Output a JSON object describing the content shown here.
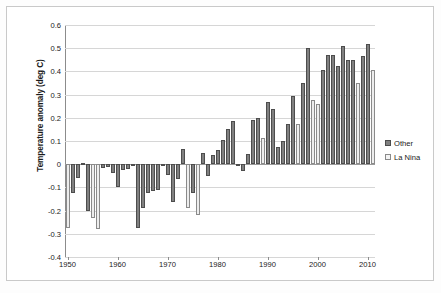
{
  "chart_data": {
    "type": "bar",
    "title": "",
    "xlabel": "",
    "ylabel": "Temperature anomaly (deg C)",
    "ylim": [
      -0.4,
      0.6
    ],
    "xlim": [
      1949.2,
      1911.8
    ],
    "grid": true,
    "legend_position": "right",
    "ytick_labels": [
      "0.6",
      "0.5",
      "0.4",
      "0.3",
      "0.2",
      "0.1",
      "0",
      "-0.1",
      "-0.2",
      "-0.3",
      "-0.4"
    ],
    "ytick_values": [
      0.6,
      0.5,
      0.4,
      0.3,
      0.2,
      0.1,
      0,
      -0.1,
      -0.2,
      -0.3,
      -0.4
    ],
    "xtick_labels": [
      "1950",
      "1960",
      "1970",
      "1980",
      "1990",
      "2000",
      "2010"
    ],
    "xtick_values": [
      1950,
      1960,
      1970,
      1980,
      1990,
      2000,
      2010
    ],
    "legend": [
      {
        "name": "Other",
        "color": "#808080"
      },
      {
        "name": "La Nina",
        "color": "#ededed"
      }
    ],
    "categories": [
      1950,
      1951,
      1952,
      1953,
      1954,
      1955,
      1956,
      1957,
      1958,
      1959,
      1960,
      1961,
      1962,
      1963,
      1964,
      1965,
      1966,
      1967,
      1968,
      1969,
      1970,
      1971,
      1972,
      1973,
      1974,
      1975,
      1976,
      1977,
      1978,
      1979,
      1980,
      1981,
      1982,
      1983,
      1984,
      1985,
      1986,
      1987,
      1988,
      1989,
      1990,
      1991,
      1992,
      1993,
      1994,
      1995,
      1996,
      1997,
      1998,
      1999,
      2000,
      2001,
      2002,
      2003,
      2004,
      2005,
      2006,
      2007,
      2008,
      2009,
      2010,
      2011
    ],
    "points": [
      {
        "year": 1950,
        "value": -0.275,
        "series": "La Nina"
      },
      {
        "year": 1951,
        "value": -0.125,
        "series": "Other"
      },
      {
        "year": 1952,
        "value": -0.06,
        "series": "Other"
      },
      {
        "year": 1953,
        "value": 0.005,
        "series": "Other"
      },
      {
        "year": 1954,
        "value": -0.2,
        "series": "Other"
      },
      {
        "year": 1955,
        "value": -0.23,
        "series": "La Nina"
      },
      {
        "year": 1956,
        "value": -0.28,
        "series": "La Nina"
      },
      {
        "year": 1957,
        "value": -0.015,
        "series": "Other"
      },
      {
        "year": 1958,
        "value": -0.01,
        "series": "Other"
      },
      {
        "year": 1959,
        "value": -0.04,
        "series": "Other"
      },
      {
        "year": 1960,
        "value": -0.1,
        "series": "Other"
      },
      {
        "year": 1961,
        "value": -0.025,
        "series": "Other"
      },
      {
        "year": 1962,
        "value": -0.02,
        "series": "Other"
      },
      {
        "year": 1963,
        "value": -0.005,
        "series": "Other"
      },
      {
        "year": 1964,
        "value": -0.275,
        "series": "Other"
      },
      {
        "year": 1965,
        "value": -0.19,
        "series": "Other"
      },
      {
        "year": 1966,
        "value": -0.125,
        "series": "Other"
      },
      {
        "year": 1967,
        "value": -0.115,
        "series": "Other"
      },
      {
        "year": 1968,
        "value": -0.11,
        "series": "Other"
      },
      {
        "year": 1969,
        "value": -0.005,
        "series": "Other"
      },
      {
        "year": 1970,
        "value": -0.045,
        "series": "Other"
      },
      {
        "year": 1971,
        "value": -0.165,
        "series": "Other"
      },
      {
        "year": 1972,
        "value": -0.065,
        "series": "Other"
      },
      {
        "year": 1973,
        "value": 0.065,
        "series": "Other"
      },
      {
        "year": 1974,
        "value": -0.19,
        "series": "La Nina"
      },
      {
        "year": 1975,
        "value": -0.125,
        "series": "Other"
      },
      {
        "year": 1976,
        "value": -0.22,
        "series": "La Nina"
      },
      {
        "year": 1977,
        "value": 0.05,
        "series": "Other"
      },
      {
        "year": 1978,
        "value": -0.05,
        "series": "Other"
      },
      {
        "year": 1979,
        "value": 0.04,
        "series": "Other"
      },
      {
        "year": 1980,
        "value": 0.06,
        "series": "Other"
      },
      {
        "year": 1981,
        "value": 0.105,
        "series": "Other"
      },
      {
        "year": 1982,
        "value": 0.15,
        "series": "Other"
      },
      {
        "year": 1983,
        "value": 0.185,
        "series": "Other"
      },
      {
        "year": 1984,
        "value": -0.005,
        "series": "Other"
      },
      {
        "year": 1985,
        "value": -0.03,
        "series": "Other"
      },
      {
        "year": 1986,
        "value": 0.045,
        "series": "Other"
      },
      {
        "year": 1987,
        "value": 0.19,
        "series": "Other"
      },
      {
        "year": 1988,
        "value": 0.2,
        "series": "Other"
      },
      {
        "year": 1989,
        "value": 0.115,
        "series": "La Nina"
      },
      {
        "year": 1990,
        "value": 0.27,
        "series": "Other"
      },
      {
        "year": 1991,
        "value": 0.24,
        "series": "Other"
      },
      {
        "year": 1992,
        "value": 0.075,
        "series": "Other"
      },
      {
        "year": 1993,
        "value": 0.1,
        "series": "Other"
      },
      {
        "year": 1994,
        "value": 0.175,
        "series": "Other"
      },
      {
        "year": 1995,
        "value": 0.295,
        "series": "Other"
      },
      {
        "year": 1996,
        "value": 0.175,
        "series": "La Nina"
      },
      {
        "year": 1997,
        "value": 0.35,
        "series": "Other"
      },
      {
        "year": 1998,
        "value": 0.5,
        "series": "Other"
      },
      {
        "year": 1999,
        "value": 0.275,
        "series": "La Nina"
      },
      {
        "year": 2000,
        "value": 0.26,
        "series": "La Nina"
      },
      {
        "year": 2001,
        "value": 0.405,
        "series": "Other"
      },
      {
        "year": 2002,
        "value": 0.47,
        "series": "Other"
      },
      {
        "year": 2003,
        "value": 0.47,
        "series": "Other"
      },
      {
        "year": 2004,
        "value": 0.425,
        "series": "Other"
      },
      {
        "year": 2005,
        "value": 0.51,
        "series": "Other"
      },
      {
        "year": 2006,
        "value": 0.45,
        "series": "Other"
      },
      {
        "year": 2007,
        "value": 0.45,
        "series": "Other"
      },
      {
        "year": 2008,
        "value": 0.35,
        "series": "La Nina"
      },
      {
        "year": 2009,
        "value": 0.465,
        "series": "Other"
      },
      {
        "year": 2010,
        "value": 0.52,
        "series": "Other"
      },
      {
        "year": 2011,
        "value": 0.405,
        "series": "La Nina"
      }
    ]
  }
}
